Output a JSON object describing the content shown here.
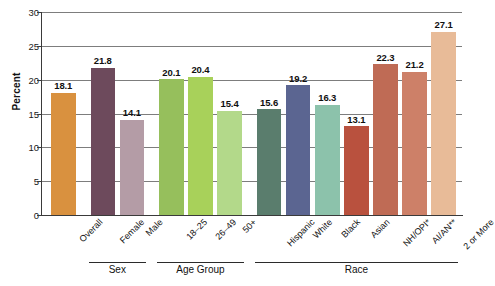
{
  "chart_data": {
    "type": "bar",
    "title": "",
    "xlabel": "",
    "ylabel": "Percent",
    "ylim": [
      0,
      30
    ],
    "ytick_step": 5,
    "ytick_labels": [
      "0",
      "5",
      "10",
      "15",
      "20",
      "25",
      "30"
    ],
    "grid": true,
    "legend": "none",
    "categories": [
      "Overall",
      "Female",
      "Male",
      "18–25",
      "26–49",
      "50+",
      "Hispanic",
      "White",
      "Black",
      "Asian",
      "NH/OPI*",
      "AI/AN**",
      "2 or More"
    ],
    "values": [
      18.1,
      21.8,
      14.1,
      20.1,
      20.4,
      15.4,
      15.6,
      19.2,
      16.3,
      13.1,
      22.3,
      21.2,
      27.1
    ],
    "value_labels": [
      "18.1",
      "21.8",
      "14.1",
      "20.1",
      "20.4",
      "15.4",
      "15.6",
      "19.2",
      "16.3",
      "13.1",
      "22.3",
      "21.2",
      "27.1"
    ],
    "bar_colors": [
      "#d9913f",
      "#6d4a5c",
      "#b49ca6",
      "#96bf5c",
      "#a8d15a",
      "#b3d98a",
      "#5a7d6d",
      "#5b6591",
      "#8cc2ab",
      "#b9513e",
      "#bf6b55",
      "#cd8068",
      "#e8bb98"
    ],
    "groups": [
      {
        "label": "",
        "start": 0,
        "end": 0
      },
      {
        "label": "Sex",
        "start": 1,
        "end": 2
      },
      {
        "label": "Age Group",
        "start": 3,
        "end": 5
      },
      {
        "label": "Race",
        "start": 6,
        "end": 12
      }
    ]
  }
}
